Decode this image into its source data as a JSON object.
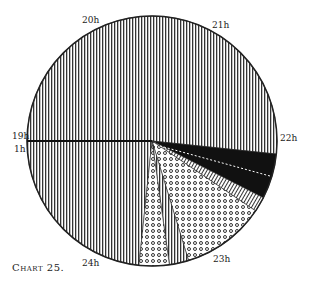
{
  "chart_data": {
    "type": "pie",
    "title": "Chart 25.",
    "center": [
      152,
      141
    ],
    "radius": 125,
    "hour_labels": [
      {
        "text": "19h",
        "x": 12,
        "y": 131
      },
      {
        "text": "1h",
        "x": 14,
        "y": 144
      },
      {
        "text": "20h",
        "x": 82,
        "y": 15
      },
      {
        "text": "21h",
        "x": 212,
        "y": 20
      },
      {
        "text": "22h",
        "x": 280,
        "y": 133
      },
      {
        "text": "23h",
        "x": 213,
        "y": 254
      },
      {
        "text": "24h",
        "x": 82,
        "y": 258
      }
    ],
    "segments": [
      {
        "name": "main-vertical-stripes",
        "pattern": "vstripe",
        "start_deg": 96,
        "end_deg": 366
      },
      {
        "name": "black",
        "pattern": "black",
        "start_deg": 6,
        "end_deg": 27
      },
      {
        "name": "crosshatch",
        "pattern": "hatch",
        "start_deg": 27,
        "end_deg": 34
      },
      {
        "name": "large-dots",
        "pattern": "dots",
        "start_deg": 34,
        "end_deg": 73
      },
      {
        "name": "narrow-stripes",
        "pattern": "vstripe",
        "start_deg": 73,
        "end_deg": 82
      },
      {
        "name": "small-dots",
        "pattern": "dots",
        "start_deg": 82,
        "end_deg": 96
      }
    ]
  },
  "caption": "Chart 25."
}
